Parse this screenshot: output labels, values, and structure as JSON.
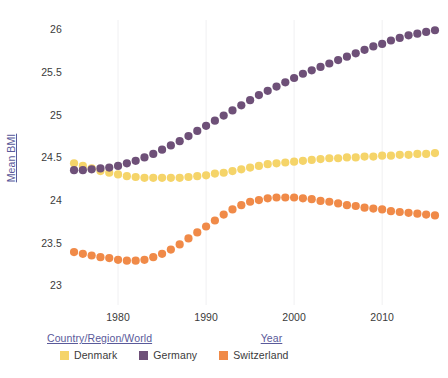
{
  "chart_data": {
    "type": "scatter",
    "title": "",
    "xlabel": "Year",
    "ylabel": "Mean BMI",
    "legend_title": "Country/Region/World",
    "legend_position": "bottom",
    "grid": true,
    "grid_axis": "x",
    "xlim": [
      1974.2,
      2016.8
    ],
    "ylim": [
      22.78,
      26.12
    ],
    "xticks": [
      1980,
      1990,
      2000,
      2010
    ],
    "xtick_labels": [
      "1980",
      "1990",
      "2000",
      "2010"
    ],
    "yticks": [
      23,
      23.5,
      24,
      24.5,
      25,
      25.5,
      26
    ],
    "ytick_labels": [
      "23",
      "23.5",
      "24",
      "24.5",
      "25",
      "25.5",
      "26"
    ],
    "x": [
      1975,
      1976,
      1977,
      1978,
      1979,
      1980,
      1981,
      1982,
      1983,
      1984,
      1985,
      1986,
      1987,
      1988,
      1989,
      1990,
      1991,
      1992,
      1993,
      1994,
      1995,
      1996,
      1997,
      1998,
      1999,
      2000,
      2001,
      2002,
      2003,
      2004,
      2005,
      2006,
      2007,
      2008,
      2009,
      2010,
      2011,
      2012,
      2013,
      2014,
      2015,
      2016
    ],
    "series": [
      {
        "name": "Denmark",
        "color": "#f5d469",
        "values": [
          24.44,
          24.41,
          24.38,
          24.35,
          24.33,
          24.31,
          24.29,
          24.28,
          24.27,
          24.27,
          24.27,
          24.27,
          24.27,
          24.28,
          24.29,
          24.3,
          24.32,
          24.33,
          24.35,
          24.37,
          24.39,
          24.41,
          24.43,
          24.44,
          24.45,
          24.46,
          24.47,
          24.48,
          24.49,
          24.5,
          24.5,
          24.51,
          24.51,
          24.52,
          24.52,
          24.53,
          24.53,
          24.54,
          24.54,
          24.55,
          24.55,
          24.56
        ]
      },
      {
        "name": "Germany",
        "color": "#6e5078",
        "values": [
          24.36,
          24.36,
          24.37,
          24.38,
          24.39,
          24.41,
          24.44,
          24.47,
          24.51,
          24.55,
          24.6,
          24.65,
          24.7,
          24.76,
          24.82,
          24.88,
          24.94,
          25.0,
          25.06,
          25.12,
          25.18,
          25.24,
          25.29,
          25.34,
          25.39,
          25.44,
          25.49,
          25.53,
          25.57,
          25.61,
          25.65,
          25.69,
          25.73,
          25.77,
          25.81,
          25.84,
          25.88,
          25.91,
          25.94,
          25.96,
          25.98,
          26.0
        ]
      },
      {
        "name": "Switzerland",
        "color": "#f08a48",
        "values": [
          23.4,
          23.38,
          23.36,
          23.34,
          23.33,
          23.31,
          23.3,
          23.3,
          23.31,
          23.34,
          23.38,
          23.43,
          23.49,
          23.56,
          23.63,
          23.7,
          23.77,
          23.84,
          23.9,
          23.95,
          23.99,
          24.01,
          24.03,
          24.04,
          24.04,
          24.04,
          24.03,
          24.02,
          24.0,
          23.99,
          23.97,
          23.95,
          23.94,
          23.92,
          23.91,
          23.9,
          23.88,
          23.87,
          23.86,
          23.85,
          23.84,
          23.83
        ]
      }
    ]
  },
  "legend": {
    "title": "Country/Region/World",
    "items": [
      {
        "label": "Denmark",
        "color": "#f5d469"
      },
      {
        "label": "Germany",
        "color": "#6e5078"
      },
      {
        "label": "Switzerland",
        "color": "#f08a48"
      }
    ]
  },
  "axes": {
    "x_title": "Year",
    "y_title": "Mean BMI"
  },
  "colors": {
    "axis_text": "#3b3b3b",
    "axis_title": "#5a5a9a",
    "grid": "#f0f0f2",
    "background": "#ffffff"
  }
}
